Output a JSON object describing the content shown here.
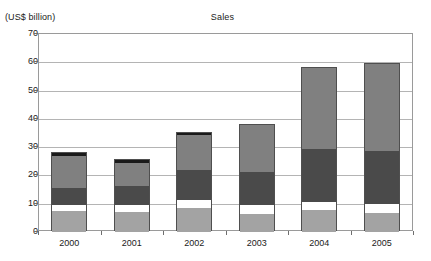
{
  "chart_data": {
    "type": "bar",
    "stacked": true,
    "title": "Sales",
    "xlabel": "",
    "ylabel": "(US$ billion)",
    "ylim": [
      0,
      70
    ],
    "ytick_labels": [
      "70",
      "60",
      "50",
      "40",
      "30",
      "20",
      "10",
      "0"
    ],
    "ytick_values": [
      70,
      60,
      50,
      40,
      30,
      20,
      10,
      0
    ],
    "grid": true,
    "legend": "none",
    "categories": [
      "2000",
      "2001",
      "2002",
      "2003",
      "2004",
      "2005"
    ],
    "series": [
      {
        "name": "segment-1",
        "color": "#a3a3a3",
        "values": [
          7.3,
          7.2,
          8.3,
          6.3,
          7.6,
          6.7
        ]
      },
      {
        "name": "segment-2",
        "color": "#ffffff",
        "values": [
          2.2,
          2.4,
          3.1,
          3.3,
          2.9,
          3.3
        ]
      },
      {
        "name": "segment-3",
        "color": "#4a4a4a",
        "values": [
          6.0,
          6.7,
          10.5,
          11.6,
          18.8,
          18.6
        ]
      },
      {
        "name": "segment-4",
        "color": "#808080",
        "values": [
          11.5,
          8.2,
          12.3,
          16.6,
          28.7,
          30.9
        ]
      },
      {
        "name": "segment-5",
        "color": "#1a1a1a",
        "values": [
          1.0,
          0.8,
          0.8,
          0.0,
          0.0,
          0.0
        ]
      }
    ],
    "totals": [
      28.0,
      25.3,
      35.0,
      37.8,
      58.0,
      59.5
    ]
  },
  "colors": {
    "axis": "#6e6e6e",
    "grid": "#b4b4b4",
    "frame": "#9a9a9a",
    "text": "#1a1a1a",
    "bar_outline": "#4f4f4f"
  }
}
